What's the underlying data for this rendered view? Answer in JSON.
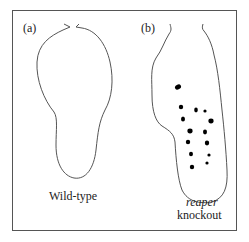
{
  "figure": {
    "panels": [
      {
        "id": "a",
        "label": "(a)",
        "caption": "Wild-type"
      },
      {
        "id": "b",
        "label": "(b)",
        "caption_line1": "reaper",
        "caption_line2": "knockout"
      }
    ],
    "colors": {
      "outline": "#555555",
      "dots": "#000000",
      "text": "#222222",
      "background": "#ffffff"
    },
    "knockout_dots": [
      {
        "x": 178,
        "y": 87,
        "rx": 3.2,
        "ry": 2.4
      },
      {
        "x": 181,
        "y": 107,
        "rx": 2.2,
        "ry": 2.2
      },
      {
        "x": 196,
        "y": 110,
        "rx": 1.8,
        "ry": 2.4
      },
      {
        "x": 205,
        "y": 111,
        "rx": 1.6,
        "ry": 1.6
      },
      {
        "x": 183,
        "y": 119,
        "rx": 2.0,
        "ry": 2.6
      },
      {
        "x": 211,
        "y": 121,
        "rx": 2.6,
        "ry": 2.4
      },
      {
        "x": 190,
        "y": 131,
        "rx": 2.6,
        "ry": 2.4
      },
      {
        "x": 205,
        "y": 132,
        "rx": 2.0,
        "ry": 2.4
      },
      {
        "x": 188,
        "y": 142,
        "rx": 2.2,
        "ry": 2.2
      },
      {
        "x": 207,
        "y": 143,
        "rx": 2.2,
        "ry": 2.4
      },
      {
        "x": 191,
        "y": 154,
        "rx": 2.0,
        "ry": 2.2
      },
      {
        "x": 209,
        "y": 155,
        "rx": 1.6,
        "ry": 1.6
      },
      {
        "x": 192,
        "y": 167,
        "rx": 2.2,
        "ry": 2.2
      },
      {
        "x": 207,
        "y": 163,
        "rx": 1.6,
        "ry": 1.6
      }
    ]
  }
}
